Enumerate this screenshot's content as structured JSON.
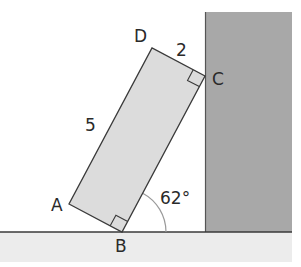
{
  "diagram": {
    "points": {
      "A": {
        "label": "A"
      },
      "B": {
        "label": "B"
      },
      "C": {
        "label": "C"
      },
      "D": {
        "label": "D"
      }
    },
    "side_labels": {
      "AD": "5",
      "DC": "2"
    },
    "angle_label": "62°",
    "colors": {
      "wall": "#a8a8a8",
      "floor": "#ececec",
      "block": "#dcdcdc",
      "stroke": "#3a3a3a",
      "arc": "#9a9a9a"
    }
  }
}
